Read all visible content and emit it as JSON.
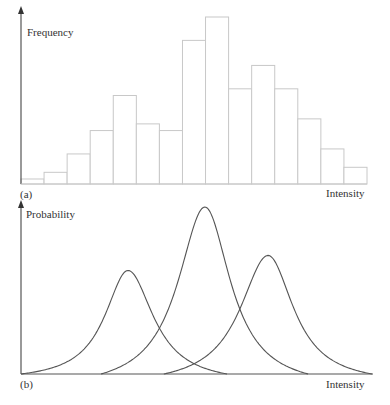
{
  "chart_data": [
    {
      "type": "bar",
      "panel_label": "(a)",
      "title": "",
      "xlabel": "Intensity",
      "ylabel": "Frequency",
      "xlim": [
        0,
        100
      ],
      "ylim": [
        0,
        110
      ],
      "grid": false,
      "note": "Histogram of 15 equal-width intensity bins; no tick labels shown, values in relative units (max = 100)",
      "categories": [
        "1",
        "2",
        "3",
        "4",
        "5",
        "6",
        "7",
        "8",
        "9",
        "10",
        "11",
        "12",
        "13",
        "14",
        "15"
      ],
      "values": [
        3,
        7,
        18,
        32,
        53,
        36,
        32,
        86,
        100,
        57,
        71,
        57,
        39,
        21,
        10
      ]
    },
    {
      "type": "line",
      "panel_label": "(b)",
      "title": "",
      "xlabel": "Intensity",
      "ylabel": "Probability",
      "xlim": [
        0,
        100
      ],
      "ylim": [
        0,
        1.05
      ],
      "grid": false,
      "note": "Three overlapping peaked probability distributions; no tick labels shown, heights relative to tallest peak",
      "series": [
        {
          "name": "distribution-1",
          "peak_x": 30.5,
          "peak_y": 0.62,
          "width_left": 8.0,
          "width_right": 8.8,
          "start_x": 0,
          "end_x": 58.7
        },
        {
          "name": "distribution-2",
          "peak_x": 52.4,
          "peak_y": 1.0,
          "width_left": 9.3,
          "width_right": 8.8,
          "start_x": 22.8,
          "end_x": 81.8
        },
        {
          "name": "distribution-3",
          "peak_x": 70.4,
          "peak_y": 0.71,
          "width_left": 9.7,
          "width_right": 8.8,
          "start_x": 40.7,
          "end_x": 100
        }
      ]
    }
  ]
}
